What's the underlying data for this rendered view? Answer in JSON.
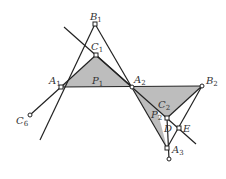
{
  "diagram": {
    "type": "geometry",
    "points": {
      "B1": {
        "x": 95,
        "y": 24,
        "label": "B",
        "sub": "1"
      },
      "C1": {
        "x": 96,
        "y": 55,
        "label": "C",
        "sub": "1"
      },
      "A1": {
        "x": 61,
        "y": 87,
        "label": "A",
        "sub": "1"
      },
      "P1": {
        "label": "P",
        "sub": "1"
      },
      "A2": {
        "x": 132,
        "y": 87,
        "label": "A",
        "sub": "2"
      },
      "B2": {
        "x": 202,
        "y": 86,
        "label": "B",
        "sub": "2"
      },
      "C2": {
        "label": "C",
        "sub": "2"
      },
      "P2": {
        "label": "P",
        "sub": "2"
      },
      "D": {
        "x": 167,
        "y": 118,
        "label": "D",
        "sub": ""
      },
      "E": {
        "x": 179,
        "y": 128,
        "label": "E",
        "sub": ""
      },
      "A3": {
        "x": 167,
        "y": 148,
        "label": "A",
        "sub": "3"
      },
      "C6": {
        "x": 30,
        "y": 115,
        "label": "C",
        "sub": "6"
      }
    },
    "colors": {
      "shade": "#bdbdbd",
      "line": "#222222"
    }
  }
}
